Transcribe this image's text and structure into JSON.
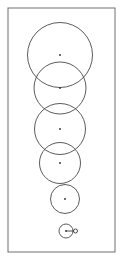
{
  "figure": {
    "title": "",
    "background_color": "#ffffff",
    "frame": {
      "name": "diagram-border",
      "x": 8,
      "y": 8,
      "width": 107,
      "height": 244,
      "stroke_color": "#6e6e6e",
      "stroke_width": 1
    },
    "stroke_color": "#4a4a4a",
    "dot_color": "#2b2b2b",
    "label": ""
  },
  "chart_data": {
    "type": "scatter",
    "title": "",
    "xlabel": "",
    "ylabel": "",
    "xlim": [
      0,
      123
    ],
    "ylim": [
      260,
      0
    ],
    "grid": false,
    "legend": null,
    "series": [
      {
        "name": "bubbles",
        "points": [
          {
            "id": "bubble-1",
            "cx": 60,
            "cy": 55,
            "r": 32.5,
            "label": ""
          },
          {
            "id": "bubble-2",
            "cx": 60,
            "cy": 88,
            "r": 26.0,
            "label": ""
          },
          {
            "id": "bubble-3",
            "cx": 60,
            "cy": 129,
            "r": 25.5,
            "label": ""
          },
          {
            "id": "bubble-4",
            "cx": 60,
            "cy": 163,
            "r": 20.5,
            "label": ""
          },
          {
            "id": "bubble-5",
            "cx": 65,
            "cy": 199,
            "r": 14.5,
            "label": ""
          },
          {
            "id": "bubble-6",
            "cx": 66,
            "cy": 231,
            "r": 7.0,
            "label": ""
          }
        ]
      }
    ],
    "center_dot_radius": 0.9,
    "marker": {
      "name": "tick-and-bead",
      "line_from": [
        66,
        231
      ],
      "line_to": [
        74,
        231
      ],
      "bead_center": [
        75.5,
        231
      ],
      "bead_radius": 2.0
    }
  }
}
